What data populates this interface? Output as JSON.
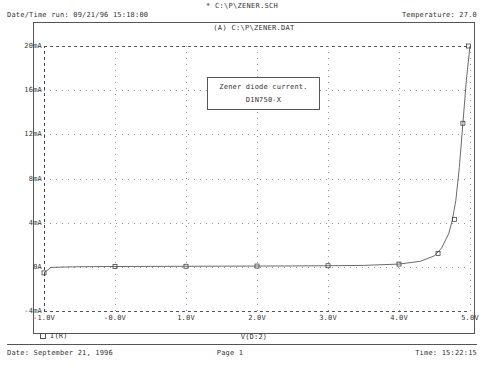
{
  "header": {
    "title": "* C:\\P\\ZENER.SCH",
    "datetime_run": "Date/Time run: 09/21/96 15:18:00",
    "temperature": "Temperature: 27.0"
  },
  "plot": {
    "title": "(A) C:\\P\\ZENER.DAT",
    "annotation_line1": "Zener diode current.",
    "annotation_line2": "D1N750-X",
    "legend_label": "I(R)",
    "legend_marker": "square-marker"
  },
  "footer": {
    "date": "Date: September 21, 1996",
    "page": "Page 1",
    "time": "Time: 15:22:15"
  },
  "chart_data": {
    "type": "line",
    "title": "(A) C:\\P\\ZENER.DAT",
    "xlabel": "V(D:2)",
    "ylabel": "",
    "xlim": [
      -1.0,
      5.0
    ],
    "ylim": [
      -4,
      20
    ],
    "xunit": "V",
    "yunit": "mA",
    "grid": true,
    "legend_position": "bottom-left",
    "xticks": [
      -1.0,
      0.0,
      1.0,
      2.0,
      3.0,
      4.0,
      5.0
    ],
    "xticklabels": [
      "-1.0V",
      "-0.0V",
      "1.0V",
      "2.0V",
      "3.0V",
      "4.0V",
      "5.0V"
    ],
    "yticks": [
      -4,
      0,
      4,
      8,
      12,
      16,
      20
    ],
    "yticklabels": [
      "-4mA",
      "0A",
      "4mA",
      "8mA",
      "12mA",
      "16mA",
      "20mA"
    ],
    "series": [
      {
        "name": "I(R)",
        "marker": "square",
        "color": "#444444",
        "x": [
          -1.0,
          -0.9,
          -0.6,
          -0.3,
          0.0,
          0.5,
          1.0,
          1.5,
          2.0,
          2.5,
          3.0,
          3.5,
          4.0,
          4.3,
          4.5,
          4.6,
          4.7,
          4.75,
          4.8,
          4.85,
          4.9,
          4.95,
          5.0
        ],
        "y": [
          -0.55,
          -0.05,
          0.0,
          0.02,
          0.03,
          0.04,
          0.05,
          0.06,
          0.07,
          0.08,
          0.1,
          0.13,
          0.25,
          0.5,
          1.0,
          1.7,
          3.0,
          4.2,
          6.0,
          9.0,
          13.0,
          17.0,
          20.0
        ],
        "markers_x": [
          -1.0,
          0.0,
          1.0,
          2.0,
          3.0,
          4.0,
          4.55,
          4.78,
          4.9,
          4.98
        ],
        "markers_y": [
          -0.55,
          0.03,
          0.05,
          0.07,
          0.1,
          0.25,
          1.2,
          4.3,
          13.0,
          20.0
        ]
      }
    ]
  }
}
